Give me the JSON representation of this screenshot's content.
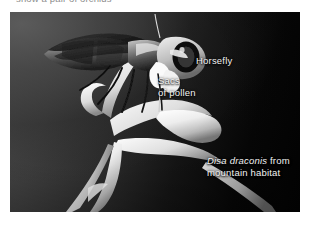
{
  "page": {
    "width": 313,
    "height": 227,
    "background_color": "#ffffff"
  },
  "top_caption": {
    "text": "show a pair of orchids",
    "note": "clipped at top edge of screenshot; only descender stubs of gray text are visible",
    "color": "#8d8d8d"
  },
  "photo": {
    "subject": "Black-and-white photograph of a horsefly carrying orchid pollen sacs above a pale Disa draconis orchid flower on a dark gradient background",
    "background_colors": {
      "upper_left": "#4a4a4a",
      "mid": "#2c2c2c",
      "lower_right": "#040404"
    },
    "labels": [
      {
        "id": "horsefly",
        "text": "Horsefly",
        "color": "#f2f2f2",
        "italic": false
      },
      {
        "id": "sacs-of-pollen",
        "line1": "Sacs",
        "line2": "of pollen",
        "color": "#f2f2f2",
        "italic": false
      },
      {
        "id": "disa-draconis",
        "species": "Disa draconis",
        "line1_tail": " from",
        "line2": "mountain habitat",
        "color": "#f2f2f2",
        "species_italic": true
      }
    ],
    "elements": [
      {
        "name": "horsefly",
        "description": "winged fly in right-facing profile with large dark compound eye, dark wings folded back, slender legs dangling"
      },
      {
        "name": "pollen-sacs",
        "description": "bright white pollinia attached to the fly's head and proboscis"
      },
      {
        "name": "orchid-flower",
        "description": "pale white Disa draconis orchid with long curved spur, arching petals and a drooping lip"
      },
      {
        "name": "orchid-stem",
        "description": "pale stalk running to the lower edge of the frame"
      }
    ]
  }
}
